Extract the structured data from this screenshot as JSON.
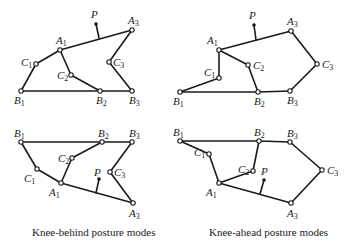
{
  "captions": {
    "left": "Knee-behind posture modes",
    "right": "Knee-ahead posture modes"
  },
  "colors": {
    "ink": "#1a1a1a",
    "background": "#ffffff"
  },
  "diagrams": [
    {
      "id": "knee-behind-upper",
      "joints": {
        "B1": [
          21,
          91
        ],
        "C1": [
          36,
          64
        ],
        "A1": [
          60,
          50
        ],
        "C2": [
          71,
          75
        ],
        "B2": [
          100,
          91
        ],
        "B3": [
          132,
          91
        ],
        "C3": [
          109,
          62
        ],
        "A3": [
          132,
          30
        ],
        "P": [
          96,
          24
        ],
        "Pbase": [
          99,
          38
        ]
      }
    },
    {
      "id": "knee-ahead-upper",
      "joints": {
        "B1": [
          180,
          92
        ],
        "C1": [
          219,
          78
        ],
        "A1": [
          219,
          50
        ],
        "C2": [
          248,
          65
        ],
        "B2": [
          258,
          92
        ],
        "B3": [
          290,
          91
        ],
        "C3": [
          317,
          64
        ],
        "A3": [
          291,
          31
        ],
        "P": [
          254,
          25
        ],
        "Pbase": [
          256,
          40
        ]
      }
    },
    {
      "id": "knee-behind-lower",
      "joints": {
        "B1": [
          21,
          142
        ],
        "C1": [
          37,
          169
        ],
        "A1": [
          61,
          183
        ],
        "C2": [
          72,
          158
        ],
        "B2": [
          102,
          142
        ],
        "B3": [
          132,
          142
        ],
        "C3": [
          110,
          172
        ],
        "A3": [
          133,
          203
        ],
        "P": [
          99,
          179
        ],
        "Pbase": [
          96,
          193
        ]
      }
    },
    {
      "id": "knee-ahead-lower",
      "joints": {
        "B1": [
          180,
          141
        ],
        "C1": [
          209,
          154
        ],
        "A1": [
          219,
          183
        ],
        "C2": [
          253,
          171
        ],
        "B2": [
          259,
          141
        ],
        "B3": [
          290,
          142
        ],
        "C3": [
          322,
          170
        ],
        "A3": [
          291,
          203
        ],
        "P": [
          264,
          180
        ],
        "Pbase": [
          260,
          194
        ]
      }
    }
  ],
  "labels": {
    "point": "P",
    "A": "A",
    "B": "B",
    "C": "C",
    "sub1": "1",
    "sub2": "2",
    "sub3": "3"
  }
}
